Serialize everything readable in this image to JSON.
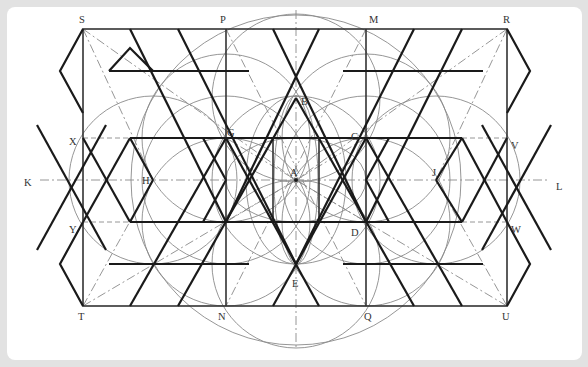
{
  "figure": {
    "type": "geometric construction diagram",
    "colors": {
      "background": "#e2e2e2",
      "panel": "#ffffff",
      "pattern_lines": "#1a1a1a",
      "construction_lines": "#8a8a8a"
    }
  },
  "labels": {
    "S": "S",
    "P": "P",
    "M": "M",
    "R": "R",
    "X": "X",
    "G": "G",
    "B": "B",
    "C": "C",
    "V": "V",
    "K": "K",
    "H": "H",
    "A": "A",
    "J": "J",
    "L": "L",
    "Y": "Y",
    "F": "F",
    "D": "D",
    "W": "W",
    "E": "E",
    "T": "T",
    "N": "N",
    "Q": "Q",
    "U": "U"
  },
  "points": [
    {
      "id": "S",
      "x": 83,
      "y": 29
    },
    {
      "id": "P",
      "x": 226,
      "y": 29
    },
    {
      "id": "M",
      "x": 366,
      "y": 29
    },
    {
      "id": "R",
      "x": 507,
      "y": 29
    },
    {
      "id": "X",
      "x": 83,
      "y": 138
    },
    {
      "id": "G",
      "x": 226,
      "y": 138
    },
    {
      "id": "B",
      "x": 296,
      "y": 98
    },
    {
      "id": "C",
      "x": 366,
      "y": 138
    },
    {
      "id": "V",
      "x": 507,
      "y": 138
    },
    {
      "id": "K",
      "x": 35,
      "y": 180
    },
    {
      "id": "H",
      "x": 153,
      "y": 180
    },
    {
      "id": "A",
      "x": 296,
      "y": 180
    },
    {
      "id": "J",
      "x": 436,
      "y": 180
    },
    {
      "id": "L",
      "x": 548,
      "y": 180
    },
    {
      "id": "Y",
      "x": 83,
      "y": 222
    },
    {
      "id": "F",
      "x": 226,
      "y": 222
    },
    {
      "id": "D",
      "x": 366,
      "y": 222
    },
    {
      "id": "W",
      "x": 507,
      "y": 222
    },
    {
      "id": "E",
      "x": 296,
      "y": 264
    },
    {
      "id": "T",
      "x": 83,
      "y": 306
    },
    {
      "id": "N",
      "x": 226,
      "y": 306
    },
    {
      "id": "Q",
      "x": 366,
      "y": 306
    },
    {
      "id": "U",
      "x": 507,
      "y": 306
    }
  ]
}
